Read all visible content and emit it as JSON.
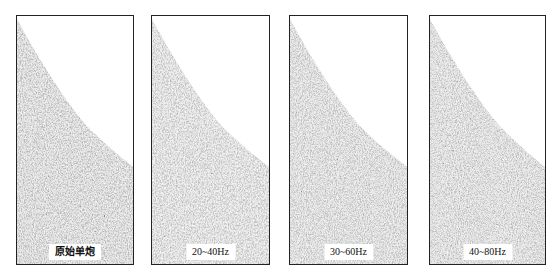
{
  "figure": {
    "panels": [
      {
        "id": "original",
        "label": "原始单炮",
        "left": 16,
        "width": 118,
        "bold": true
      },
      {
        "id": "band-20-40",
        "label": "20~40Hz",
        "left": 151,
        "width": 119,
        "bold": false
      },
      {
        "id": "band-30-60",
        "label": "30~60Hz",
        "left": 289,
        "width": 119,
        "bold": false
      },
      {
        "id": "band-40-80",
        "label": "40~80Hz",
        "left": 429,
        "width": 117,
        "bold": false
      }
    ],
    "style": {
      "border_color": "#222222",
      "data_fill": "#7a7a7a",
      "background": "#ffffff"
    }
  }
}
